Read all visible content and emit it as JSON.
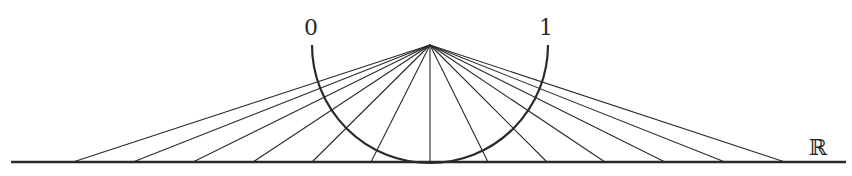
{
  "diagram": {
    "labels": {
      "left_endpoint": "0",
      "right_endpoint": "1",
      "line": "ℝ"
    },
    "apex": {
      "x": 430,
      "y": 45
    },
    "semicircle": {
      "cx": 430,
      "cy": 45,
      "r": 118
    },
    "real_line": {
      "x1": 11,
      "x2": 846,
      "y": 162
    },
    "ray_endpoints_x": [
      73,
      133,
      193,
      253,
      312,
      371,
      430,
      488,
      547,
      605,
      665,
      725,
      785
    ],
    "colors": {
      "stroke": "#2a2a2a",
      "background": "#ffffff"
    }
  }
}
